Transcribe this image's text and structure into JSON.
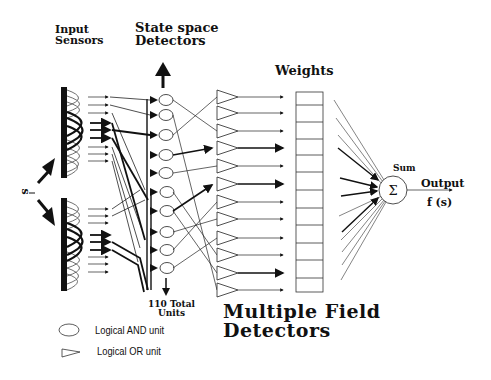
{
  "labels": {
    "input_sensors": [
      "Input",
      "Sensors"
    ],
    "state_space": [
      "State space",
      "Detectors"
    ],
    "weights": "Weights",
    "sum": "Sum",
    "output": "Output",
    "output_fn": "f (s)",
    "s_label": "s",
    "total_units": [
      "110 Total",
      "Units"
    ],
    "multiple_field": [
      "Multiple Field",
      "Detectors"
    ]
  },
  "legend": [
    {
      "shape": "oval",
      "label": "Logical AND unit"
    },
    {
      "shape": "triangle",
      "label": "Logical OR unit"
    }
  ],
  "sum_symbol": "Σ",
  "structure": {
    "sensor_arrays": 2,
    "and_units_visible": 10,
    "or_units_visible": 12,
    "weight_cells": 12
  }
}
